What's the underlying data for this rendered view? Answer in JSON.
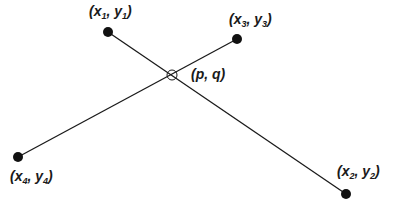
{
  "diagram": {
    "colors": {
      "line": "#1a1a1a",
      "point": "#111111",
      "background": "#ffffff"
    },
    "points": [
      {
        "id": "p1",
        "x": 108,
        "y": 32,
        "var_x": "x",
        "sub_x": "1",
        "var_y": "y",
        "sub_y": "1"
      },
      {
        "id": "p2",
        "x": 346,
        "y": 194,
        "var_x": "x",
        "sub_x": "2",
        "var_y": "y",
        "sub_y": "2"
      },
      {
        "id": "p3",
        "x": 237,
        "y": 39,
        "var_x": "x",
        "sub_x": "3",
        "var_y": "y",
        "sub_y": "3"
      },
      {
        "id": "p4",
        "x": 18,
        "y": 157,
        "var_x": "x",
        "sub_x": "4",
        "var_y": "y",
        "sub_y": "4"
      }
    ],
    "segments": [
      {
        "from": "p1",
        "to": "p2"
      },
      {
        "from": "p4",
        "to": "p3"
      }
    ],
    "intersection": {
      "x": 172,
      "y": 75,
      "label": "(p, q)"
    },
    "labels": {
      "p1": {
        "open": "(",
        "x": "x",
        "xs": "1",
        "sep": ", ",
        "y": "y",
        "ys": "1",
        "close": ")"
      },
      "p2": {
        "open": "(",
        "x": "x",
        "xs": "2",
        "sep": ", ",
        "y": "y",
        "ys": "2",
        "close": ")"
      },
      "p3": {
        "open": "(",
        "x": "x",
        "xs": "3",
        "sep": ", ",
        "y": "y",
        "ys": "3",
        "close": ")"
      },
      "p4": {
        "open": "(",
        "x": "x",
        "xs": "4",
        "sep": ", ",
        "y": "y",
        "ys": "4",
        "close": ")"
      },
      "intersection": "(p, q)"
    }
  }
}
